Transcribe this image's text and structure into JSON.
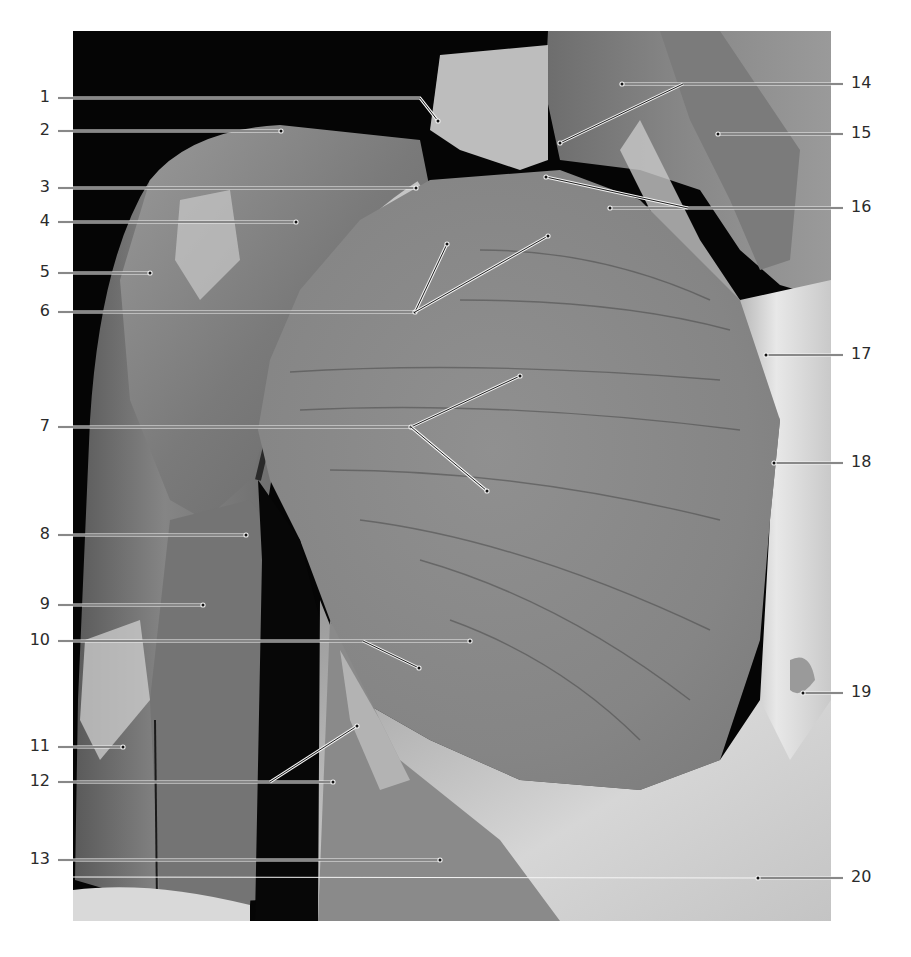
{
  "figure": {
    "type": "anatomical-photograph",
    "background_color": "#050505",
    "page_background": "#ffffff",
    "label_color": "#2b2b2b"
  },
  "labels_left": [
    {
      "num": "1",
      "y": 98,
      "path": [
        [
          58,
          98
        ],
        [
          420,
          98
        ],
        [
          438,
          121
        ]
      ]
    },
    {
      "num": "2",
      "y": 131,
      "path": [
        [
          58,
          131
        ],
        [
          281,
          131
        ]
      ]
    },
    {
      "num": "3",
      "y": 188,
      "path": [
        [
          58,
          188
        ],
        [
          416,
          188
        ]
      ]
    },
    {
      "num": "4",
      "y": 222,
      "path": [
        [
          58,
          222
        ],
        [
          296,
          222
        ]
      ]
    },
    {
      "num": "5",
      "y": 273,
      "path": [
        [
          58,
          273
        ],
        [
          150,
          273
        ]
      ]
    },
    {
      "num": "6",
      "y": 312,
      "path": [
        [
          58,
          312
        ],
        [
          415,
          312
        ]
      ],
      "branches": [
        [
          [
            415,
            312
          ],
          [
            447,
            244
          ]
        ],
        [
          [
            415,
            312
          ],
          [
            548,
            236
          ]
        ]
      ]
    },
    {
      "num": "7",
      "y": 427,
      "path": [
        [
          58,
          427
        ],
        [
          411,
          427
        ]
      ],
      "branches": [
        [
          [
            411,
            427
          ],
          [
            520,
            376
          ]
        ],
        [
          [
            411,
            427
          ],
          [
            487,
            491
          ]
        ]
      ]
    },
    {
      "num": "8",
      "y": 535,
      "path": [
        [
          58,
          535
        ],
        [
          246,
          535
        ]
      ]
    },
    {
      "num": "9",
      "y": 605,
      "path": [
        [
          58,
          605
        ],
        [
          203,
          605
        ]
      ]
    },
    {
      "num": "10",
      "y": 641,
      "path": [
        [
          58,
          641
        ],
        [
          470,
          641
        ]
      ],
      "branches": [
        [
          [
            363,
            641
          ],
          [
            419,
            668
          ]
        ]
      ]
    },
    {
      "num": "11",
      "y": 747,
      "path": [
        [
          58,
          747
        ],
        [
          123,
          747
        ]
      ]
    },
    {
      "num": "12",
      "y": 782,
      "path": [
        [
          58,
          782
        ],
        [
          333,
          782
        ]
      ],
      "branches": [
        [
          [
            270,
            782
          ],
          [
            357,
            726
          ]
        ]
      ]
    },
    {
      "num": "13",
      "y": 860,
      "path": [
        [
          58,
          860
        ],
        [
          440,
          860
        ]
      ]
    }
  ],
  "labels_right": [
    {
      "num": "14",
      "y": 84,
      "path": [
        [
          843,
          84
        ],
        [
          622,
          84
        ]
      ],
      "branches": [
        [
          [
            683,
            84
          ],
          [
            560,
            143
          ]
        ]
      ]
    },
    {
      "num": "15",
      "y": 134,
      "path": [
        [
          843,
          134
        ],
        [
          718,
          134
        ]
      ]
    },
    {
      "num": "16",
      "y": 208,
      "path": [
        [
          843,
          208
        ],
        [
          610,
          208
        ]
      ],
      "branches": [
        [
          [
            688,
            208
          ],
          [
            546,
            177
          ]
        ]
      ]
    },
    {
      "num": "17",
      "y": 355,
      "path": [
        [
          843,
          355
        ],
        [
          766,
          355
        ]
      ]
    },
    {
      "num": "18",
      "y": 463,
      "path": [
        [
          843,
          463
        ],
        [
          774,
          463
        ]
      ]
    },
    {
      "num": "19",
      "y": 693,
      "path": [
        [
          843,
          693
        ],
        [
          803,
          693
        ]
      ]
    },
    {
      "num": "20",
      "y": 878,
      "path": [
        [
          843,
          878
        ],
        [
          758,
          878
        ]
      ]
    }
  ]
}
